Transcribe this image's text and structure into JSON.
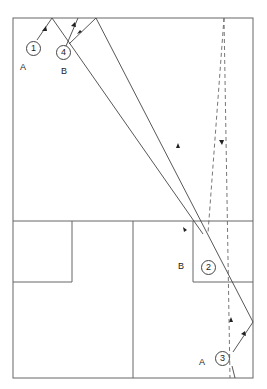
{
  "diagram": {
    "points": [
      {
        "id": "1",
        "side_label": "A",
        "x": 33,
        "y": 47
      },
      {
        "id": "4",
        "side_label": "B",
        "x": 64,
        "y": 53
      },
      {
        "id": "2",
        "side_label": "B",
        "x": 208,
        "y": 240
      },
      {
        "id": "3",
        "side_label": "A",
        "x": 229,
        "y": 358
      }
    ],
    "stroke_color": "#555555",
    "caption": ""
  }
}
